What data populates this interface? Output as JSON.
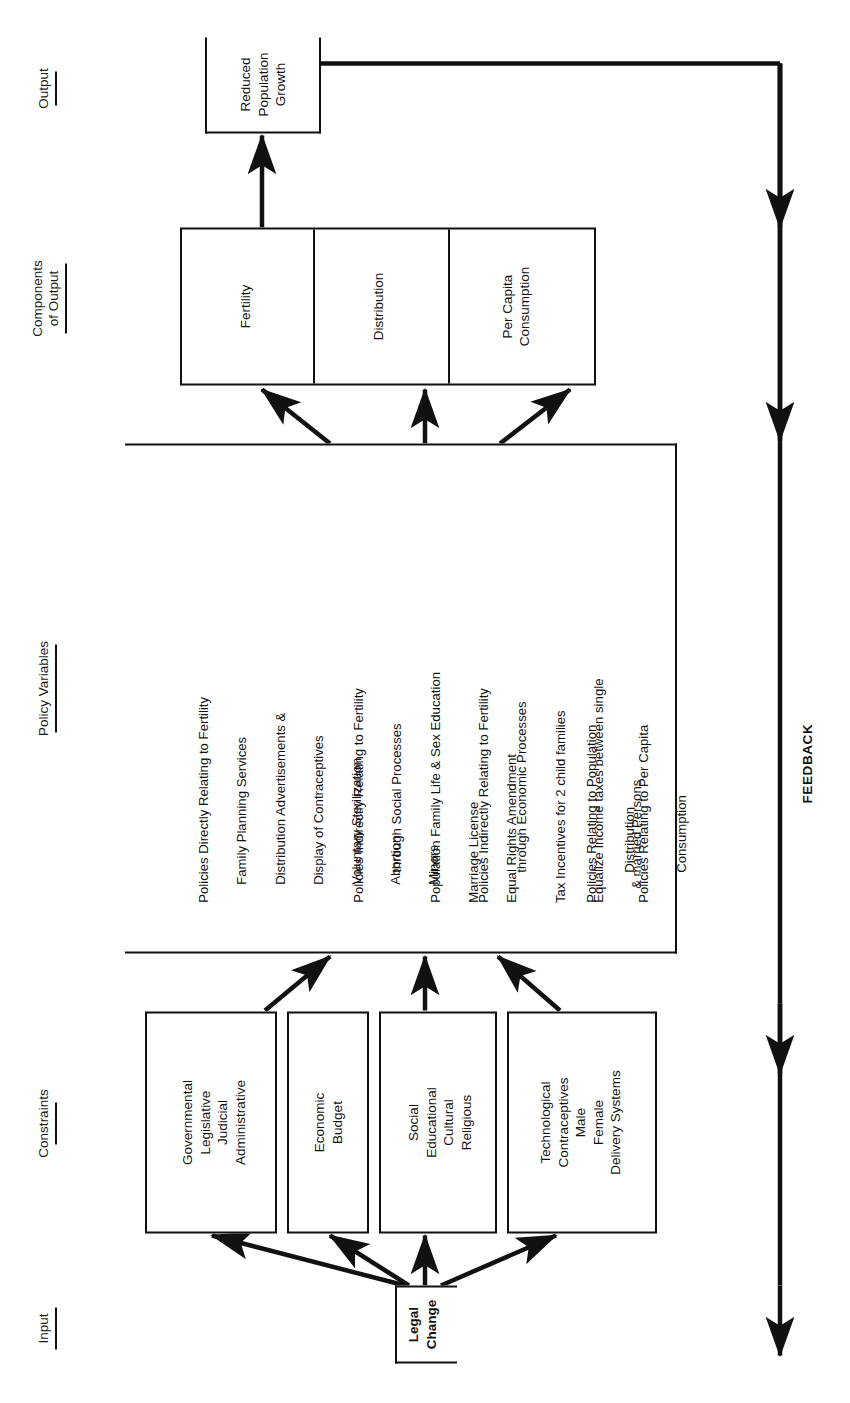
{
  "diagram": {
    "title_sections": [
      {
        "id": "input",
        "label": "Input"
      },
      {
        "id": "constraints",
        "label": "Constraints"
      },
      {
        "id": "policy-variables",
        "label": "Policy Variables"
      },
      {
        "id": "components-of-output",
        "label": "Components",
        "label2": "of Output"
      },
      {
        "id": "output",
        "label": "Output"
      }
    ],
    "input_node": {
      "line1": "Legal",
      "line2": "Change"
    },
    "constraints": [
      {
        "id": "governmental",
        "lines": [
          "Governmental",
          "Legislative",
          "Judicial",
          "Administrative"
        ]
      },
      {
        "id": "economic",
        "lines": [
          "Economic",
          "Budget"
        ]
      },
      {
        "id": "social",
        "lines": [
          "Social",
          "Educational",
          "Cultural",
          "Religious"
        ]
      },
      {
        "id": "technological",
        "lines": [
          "Technological",
          "Contraceptives",
          "Male",
          "Female",
          "Delivery Systems"
        ]
      }
    ],
    "policy_groups": [
      {
        "id": "direct-fertility",
        "lines": [
          "Policies Directly Relating to Fertility",
          "Family Planning Services",
          "Distribution Advertisements &",
          "Display of Contraceptives",
          "Voluntary Sterilization",
          "Abortion",
          "Minors"
        ]
      },
      {
        "id": "indirect-social",
        "lines": [
          "Policies Indirectly Relating to Fertility",
          "through Social Processes",
          "Population Family Life & Sex Education",
          "Marriage License",
          "Equal Rights Amendment"
        ]
      },
      {
        "id": "indirect-economic",
        "lines": [
          "Policies Indirectly Relating to Fertility",
          "through Economic Processes",
          "Tax Incentives for 2 child families",
          "Equalize Income taxes between single",
          "& married Persons"
        ]
      },
      {
        "id": "population-distribution",
        "lines": [
          "Policies Relating to Population",
          "Distribution"
        ]
      },
      {
        "id": "per-capita-consumption",
        "lines": [
          "Policies Relating to Per Capita",
          "Consumption"
        ]
      }
    ],
    "components_of_output": [
      {
        "id": "fertility",
        "lines": [
          "Fertility"
        ]
      },
      {
        "id": "distribution",
        "lines": [
          "Distribution"
        ]
      },
      {
        "id": "per-capita-consumption",
        "lines": [
          "Per Capita",
          "Consumption"
        ]
      }
    ],
    "output_node": {
      "lines": [
        "Reduced",
        "Population",
        "Growth"
      ]
    },
    "feedback_label": "FEEDBACK",
    "colors": {
      "ink": "#111111",
      "paper": "#ffffff"
    }
  }
}
